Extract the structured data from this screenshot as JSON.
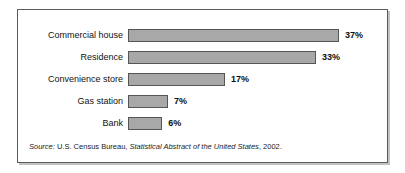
{
  "chart_data": {
    "type": "bar",
    "orientation": "horizontal",
    "title": "",
    "subtitle": "",
    "xlabel": "",
    "ylabel": "",
    "grid": false,
    "legend": null,
    "xlim": [
      0,
      40
    ],
    "categories": [
      "Commercial house",
      "Residence",
      "Convenience store",
      "Gas station",
      "Bank"
    ],
    "values": [
      37,
      33,
      17,
      7,
      6
    ],
    "value_labels": [
      "37%",
      "33%",
      "17%",
      "7%",
      "6%"
    ],
    "units": "percent",
    "series": [
      {
        "name": "",
        "values": [
          37,
          33,
          17,
          7,
          6
        ]
      }
    ],
    "colors": {
      "bar_fill": "#a8a8a8",
      "bar_border": "#565656",
      "frame": "#5b5b5b",
      "text": "#111111",
      "background": "#ffffff"
    }
  },
  "source": {
    "prefix": "Source:",
    "publisher": "U.S. Census Bureau,",
    "publication": "Statistical Abstract of the United States",
    "suffix": ", 2002."
  }
}
